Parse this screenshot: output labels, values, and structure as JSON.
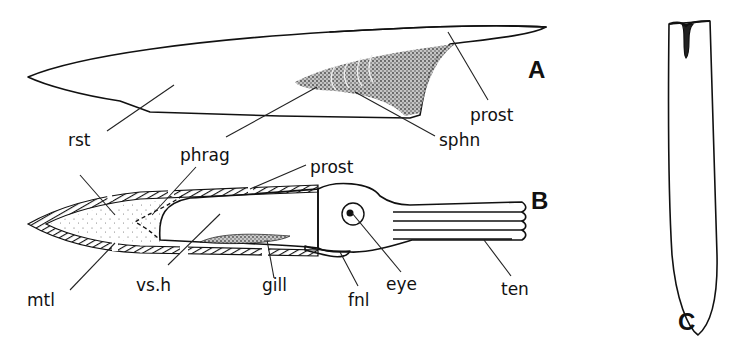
{
  "figure": {
    "panels": {
      "A": {
        "letter": "A",
        "subject": "rostrum and phragmocone (lateral view)"
      },
      "B": {
        "letter": "B",
        "subject": "reconstructed animal in longitudinal section"
      },
      "C": {
        "letter": "C",
        "subject": "rostrum with alveolar groove"
      }
    },
    "labels_A": {
      "rst": "rst",
      "phrag": "phrag",
      "prost": "prost",
      "sphn": "sphn"
    },
    "labels_B": {
      "prost": "prost",
      "mtl": "mtl",
      "vsh": "vs.h",
      "gill": "gill",
      "fnl": "fnl",
      "eye": "eye",
      "ten": "ten"
    },
    "colors": {
      "ink": "#111111",
      "background": "#ffffff"
    }
  }
}
